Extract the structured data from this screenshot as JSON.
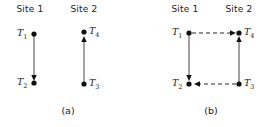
{
  "figure": {
    "panels": [
      {
        "caption": "(a)",
        "headers": [
          "Site 1",
          "Site 2"
        ],
        "nodes": [
          {
            "id": "T1",
            "label": "T",
            "sub": "1",
            "site": "Site 1",
            "position": "top-left"
          },
          {
            "id": "T2",
            "label": "T",
            "sub": "2",
            "site": "Site 1",
            "position": "bottom-left"
          },
          {
            "id": "T4",
            "label": "T",
            "sub": "4",
            "site": "Site 2",
            "position": "top-right"
          },
          {
            "id": "T3",
            "label": "T",
            "sub": "3",
            "site": "Site 2",
            "position": "bottom-right"
          }
        ],
        "edges": [
          {
            "from": "T1",
            "to": "T2",
            "style": "solid",
            "direction": "down"
          },
          {
            "from": "T3",
            "to": "T4",
            "style": "solid",
            "direction": "up"
          }
        ]
      },
      {
        "caption": "(b)",
        "headers": [
          "Site 1",
          "Site 2"
        ],
        "nodes": [
          {
            "id": "T1",
            "label": "T",
            "sub": "1",
            "site": "Site 1",
            "position": "top-left"
          },
          {
            "id": "T2",
            "label": "T",
            "sub": "2",
            "site": "Site 1",
            "position": "bottom-left"
          },
          {
            "id": "T4",
            "label": "T",
            "sub": "4",
            "site": "Site 2",
            "position": "top-right"
          },
          {
            "id": "T3",
            "label": "T",
            "sub": "3",
            "site": "Site 2",
            "position": "bottom-right"
          }
        ],
        "edges": [
          {
            "from": "T1",
            "to": "T2",
            "style": "solid",
            "direction": "down"
          },
          {
            "from": "T3",
            "to": "T4",
            "style": "solid",
            "direction": "up"
          },
          {
            "from": "T1",
            "to": "T4",
            "style": "dashed",
            "direction": "right"
          },
          {
            "from": "T3",
            "to": "T2",
            "style": "dashed",
            "direction": "left"
          }
        ]
      }
    ],
    "colors": {
      "background": "#ffffff",
      "node": "#111111",
      "solid_edge": "#555555",
      "dashed_edge": "#2b2b2b",
      "text": "#1a1a1a"
    }
  }
}
